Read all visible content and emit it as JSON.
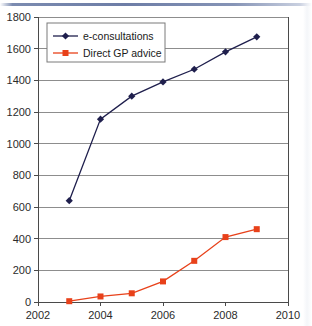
{
  "chart_data": {
    "type": "line",
    "title": "",
    "subtitle": "",
    "xlabel": "",
    "ylabel": "",
    "x": [
      2003,
      2004,
      2005,
      2006,
      2007,
      2008,
      2009
    ],
    "xlim": [
      2002,
      2010
    ],
    "ylim": [
      0,
      1800
    ],
    "x_ticks": [
      2002,
      2004,
      2006,
      2008,
      2010
    ],
    "x_tick_labels": [
      "2002",
      "2004",
      "2006",
      "2008",
      "2010"
    ],
    "y_ticks": [
      0,
      200,
      400,
      600,
      800,
      1000,
      1200,
      1400,
      1600,
      1800
    ],
    "y_tick_labels": [
      "0",
      "200",
      "400",
      "600",
      "800",
      "1000",
      "1200",
      "1400",
      "1600",
      "1800"
    ],
    "grid": "horizontal",
    "legend_position": "top-left",
    "series": [
      {
        "name": "e-consultations",
        "color": "#1f1f4d",
        "marker": "diamond",
        "values": [
          640,
          1155,
          1300,
          1390,
          1470,
          1580,
          1675
        ]
      },
      {
        "name": "Direct GP advice",
        "color": "#e8411a",
        "marker": "square",
        "values": [
          5,
          35,
          55,
          130,
          260,
          410,
          460
        ]
      }
    ],
    "legend": [
      {
        "label": "e-consultations",
        "color": "#1f1f4d",
        "marker": "diamond"
      },
      {
        "label": "Direct GP advice",
        "color": "#e8411a",
        "marker": "square"
      }
    ]
  },
  "decor": {
    "top_rule_color": "#6d7da6",
    "gridline_color": "#8d8d8d",
    "axis_color": "#4a4a4a"
  }
}
